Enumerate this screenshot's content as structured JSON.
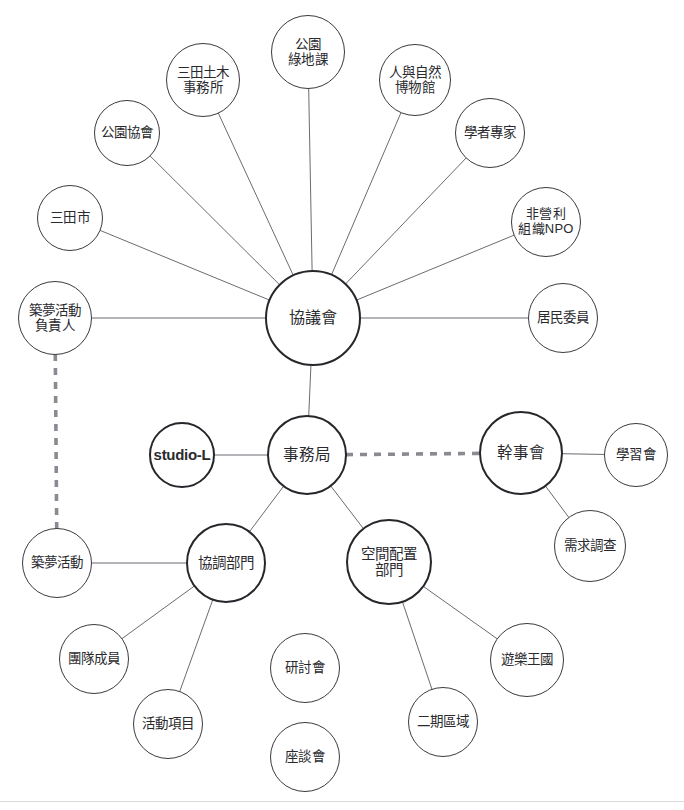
{
  "diagram": {
    "type": "node-link-network",
    "title": "",
    "background_color": "#ffffff",
    "node_stroke_color": "#3a3a40",
    "node_stroke_color_emphasis": "#26262b",
    "edge_color": "#6b6b72",
    "edge_color_strong": "#4a4a50",
    "dashed_edge_color": "#8a8a90",
    "text_color": "#2a2a2e",
    "nodes": [
      {
        "id": "kouen-ryokuchi",
        "label": "公園\n綠地課",
        "cx": 308,
        "cy": 52,
        "r": 37,
        "emphasis": "thin",
        "font": 13.5,
        "script": "cjk"
      },
      {
        "id": "sanda-doboku",
        "label": "三田土木\n事務所",
        "cx": 203,
        "cy": 80,
        "r": 37,
        "emphasis": "thin",
        "font": 13.5,
        "script": "cjk"
      },
      {
        "id": "hito-shizen-hakubutsukan",
        "label": "人與自然\n博物館",
        "cx": 415,
        "cy": 80,
        "r": 36,
        "emphasis": "thin",
        "font": 13.5,
        "script": "cjk"
      },
      {
        "id": "kouen-kyoukai",
        "label": "公園協會",
        "cx": 127,
        "cy": 133,
        "r": 33,
        "emphasis": "thin",
        "font": 13.5,
        "script": "cjk"
      },
      {
        "id": "gakusha-senka",
        "label": "學者專家",
        "cx": 490,
        "cy": 133,
        "r": 35,
        "emphasis": "thin",
        "font": 13.5,
        "script": "cjk"
      },
      {
        "id": "sanda-shi",
        "label": "三田市",
        "cx": 70,
        "cy": 218,
        "r": 33,
        "emphasis": "thin",
        "font": 13.5,
        "script": "cjk"
      },
      {
        "id": "npo",
        "label": "非營利\n組織NPO",
        "cx": 546,
        "cy": 222,
        "r": 35,
        "emphasis": "thin",
        "font": 13,
        "script": "cjk"
      },
      {
        "id": "yumezukuri-sekininsha",
        "label": "築夢活動\n負責人",
        "cx": 55,
        "cy": 318,
        "r": 37,
        "emphasis": "thin",
        "font": 13.5,
        "script": "cjk"
      },
      {
        "id": "kyougikai",
        "label": "協議會",
        "cx": 313,
        "cy": 318,
        "r": 48,
        "emphasis": "thick",
        "font": 16,
        "script": "cjk"
      },
      {
        "id": "jumin-iin",
        "label": "居民委員",
        "cx": 563,
        "cy": 318,
        "r": 35,
        "emphasis": "thin",
        "font": 13.5,
        "script": "cjk"
      },
      {
        "id": "studio-l",
        "label": "studio-L",
        "cx": 182,
        "cy": 455,
        "r": 33,
        "emphasis": "thick",
        "font": 15,
        "script": "latin"
      },
      {
        "id": "jimukyoku",
        "label": "事務局",
        "cx": 307,
        "cy": 455,
        "r": 40,
        "emphasis": "thick",
        "font": 15.5,
        "script": "cjk"
      },
      {
        "id": "kanjikai",
        "label": "幹事會",
        "cx": 521,
        "cy": 453,
        "r": 42,
        "emphasis": "thick",
        "font": 15.5,
        "script": "cjk"
      },
      {
        "id": "gakushukai",
        "label": "學習會",
        "cx": 636,
        "cy": 455,
        "r": 32,
        "emphasis": "thin",
        "font": 13.5,
        "script": "cjk"
      },
      {
        "id": "juyou-chousa",
        "label": "需求調查",
        "cx": 590,
        "cy": 546,
        "r": 36,
        "emphasis": "thin",
        "font": 13.5,
        "script": "cjk"
      },
      {
        "id": "yumezukuri-katsudou",
        "label": "築夢活動",
        "cx": 57,
        "cy": 563,
        "r": 35,
        "emphasis": "thin",
        "font": 13.5,
        "script": "cjk"
      },
      {
        "id": "kyouchou-bumon",
        "label": "協調部門",
        "cx": 226,
        "cy": 563,
        "r": 40,
        "emphasis": "thick",
        "font": 14.5,
        "script": "cjk"
      },
      {
        "id": "kuukan-haichi-bumon",
        "label": "空間配置\n部門",
        "cx": 389,
        "cy": 562,
        "r": 43,
        "emphasis": "thick",
        "font": 14.5,
        "script": "cjk"
      },
      {
        "id": "dantai-seiin",
        "label": "團隊成員",
        "cx": 94,
        "cy": 659,
        "r": 35,
        "emphasis": "thin",
        "font": 13.5,
        "script": "cjk"
      },
      {
        "id": "kentoukai",
        "label": "研討會",
        "cx": 305,
        "cy": 668,
        "r": 35,
        "emphasis": "thin",
        "font": 13.5,
        "script": "cjk"
      },
      {
        "id": "yuuraku-oukoku",
        "label": "遊樂王國",
        "cx": 527,
        "cy": 660,
        "r": 37,
        "emphasis": "thin",
        "font": 13.5,
        "script": "cjk"
      },
      {
        "id": "katsudou-koumoku",
        "label": "活動項目",
        "cx": 168,
        "cy": 724,
        "r": 35,
        "emphasis": "thin",
        "font": 13.5,
        "script": "cjk"
      },
      {
        "id": "niki-kuiki",
        "label": "二期區域",
        "cx": 443,
        "cy": 722,
        "r": 35,
        "emphasis": "thin",
        "font": 13.5,
        "script": "cjk"
      },
      {
        "id": "zadankai",
        "label": "座談會",
        "cx": 305,
        "cy": 757,
        "r": 35,
        "emphasis": "thin",
        "font": 13.5,
        "script": "cjk"
      }
    ],
    "edges": [
      {
        "from": "kouen-ryokuchi",
        "to": "kyougikai",
        "style": "solid"
      },
      {
        "from": "sanda-doboku",
        "to": "kyougikai",
        "style": "solid"
      },
      {
        "from": "hito-shizen-hakubutsukan",
        "to": "kyougikai",
        "style": "solid"
      },
      {
        "from": "kouen-kyoukai",
        "to": "kyougikai",
        "style": "solid"
      },
      {
        "from": "gakusha-senka",
        "to": "kyougikai",
        "style": "solid"
      },
      {
        "from": "sanda-shi",
        "to": "kyougikai",
        "style": "solid"
      },
      {
        "from": "npo",
        "to": "kyougikai",
        "style": "solid"
      },
      {
        "from": "yumezukuri-sekininsha",
        "to": "kyougikai",
        "style": "solid"
      },
      {
        "from": "jumin-iin",
        "to": "kyougikai",
        "style": "solid"
      },
      {
        "from": "kyougikai",
        "to": "jimukyoku",
        "style": "solid"
      },
      {
        "from": "studio-l",
        "to": "jimukyoku",
        "style": "solid"
      },
      {
        "from": "jimukyoku",
        "to": "kanjikai",
        "style": "dashed"
      },
      {
        "from": "kanjikai",
        "to": "gakushukai",
        "style": "solid"
      },
      {
        "from": "kanjikai",
        "to": "juyou-chousa",
        "style": "solid"
      },
      {
        "from": "jimukyoku",
        "to": "kyouchou-bumon",
        "style": "solid"
      },
      {
        "from": "jimukyoku",
        "to": "kuukan-haichi-bumon",
        "style": "solid"
      },
      {
        "from": "yumezukuri-katsudou",
        "to": "kyouchou-bumon",
        "style": "solid"
      },
      {
        "from": "kyouchou-bumon",
        "to": "dantai-seiin",
        "style": "solid"
      },
      {
        "from": "kyouchou-bumon",
        "to": "katsudou-koumoku",
        "style": "solid"
      },
      {
        "from": "kuukan-haichi-bumon",
        "to": "yuuraku-oukoku",
        "style": "solid"
      },
      {
        "from": "kuukan-haichi-bumon",
        "to": "niki-kuiki",
        "style": "solid"
      },
      {
        "from": "yumezukuri-sekininsha",
        "to": "yumezukuri-katsudou",
        "style": "dashed"
      }
    ],
    "footer_rule": {
      "y": 801
    }
  }
}
